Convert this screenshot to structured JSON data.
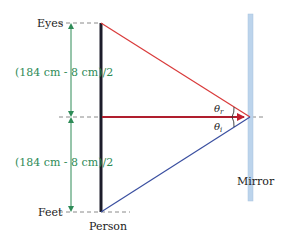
{
  "labels": {
    "eyes": "Eyes",
    "feet": "Feet",
    "person": "Person",
    "mirror": "Mirror",
    "dimension_upper": "(184 cm - 8 cm)/2",
    "dimension_lower": "(184 cm - 8 cm)/2",
    "theta_r": "θ",
    "theta_r_sub": "r",
    "theta_i": "θ",
    "theta_i_sub": "i"
  },
  "colors": {
    "reflected_ray": "#d93a3a",
    "incident_ray": "#3a4fa0",
    "horizontal_ray": "#b01e2e",
    "dimension": "#2e8b57",
    "mirror": "#bcd4ec",
    "person": "#1c1c2a",
    "dashed": "#888888"
  }
}
